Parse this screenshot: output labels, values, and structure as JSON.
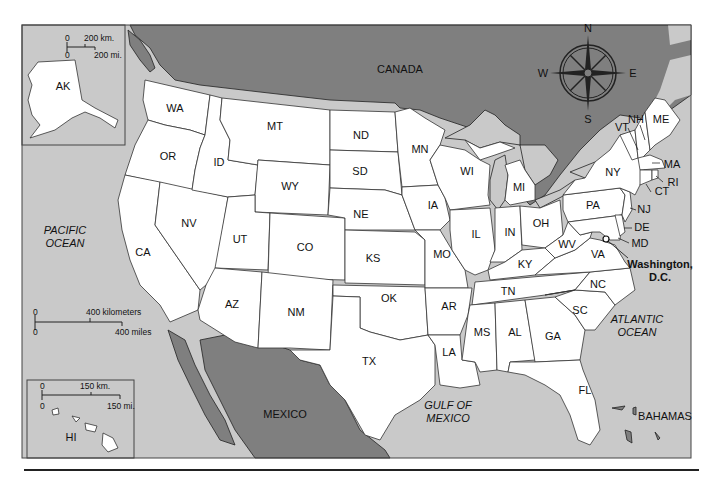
{
  "map": {
    "title": "United States",
    "countries": {
      "canada": "CANADA",
      "mexico": "MEXICO",
      "bahamas": "BAHAMAS"
    },
    "oceans": {
      "pacific": [
        "PACIFIC",
        "OCEAN"
      ],
      "atlantic": [
        "ATLANTIC",
        "OCEAN"
      ],
      "gulf": [
        "GULF OF",
        "MEXICO"
      ]
    },
    "capital": {
      "line1": "Washington,",
      "line2": "D.C."
    },
    "compass": {
      "n": "N",
      "s": "S",
      "e": "E",
      "w": "W"
    },
    "states": {
      "WA": "WA",
      "OR": "OR",
      "CA": "CA",
      "NV": "NV",
      "ID": "ID",
      "MT": "MT",
      "WY": "WY",
      "UT": "UT",
      "AZ": "AZ",
      "CO": "CO",
      "NM": "NM",
      "ND": "ND",
      "SD": "SD",
      "NE": "NE",
      "KS": "KS",
      "OK": "OK",
      "TX": "TX",
      "MN": "MN",
      "IA": "IA",
      "MO": "MO",
      "AR": "AR",
      "LA": "LA",
      "WI": "WI",
      "IL": "IL",
      "MI": "MI",
      "IN": "IN",
      "OH": "OH",
      "KY": "KY",
      "TN": "TN",
      "MS": "MS",
      "AL": "AL",
      "GA": "GA",
      "FL": "FL",
      "SC": "SC",
      "NC": "NC",
      "VA": "VA",
      "WV": "WV",
      "PA": "PA",
      "NY": "NY",
      "VT": "VT",
      "NH": "NH",
      "ME": "ME",
      "MA": "MA",
      "RI": "RI",
      "CT": "CT",
      "NJ": "NJ",
      "DE": "DE",
      "MD": "MD",
      "AK": "AK",
      "HI": "HI"
    },
    "scales": {
      "main": {
        "zero_km": "0",
        "km": "400 kilometers",
        "zero_mi": "0",
        "mi": "400 miles"
      },
      "alaska": {
        "zero_km": "0",
        "km": "200 km.",
        "zero_mi": "0",
        "mi": "200 mi."
      },
      "hawaii": {
        "zero_km": "0",
        "km": "150 km.",
        "zero_mi": "0",
        "mi": "150 mi."
      }
    },
    "colors": {
      "water": "#c9c9c9",
      "foreign_land": "#7f7f7f",
      "us_land": "#ffffff",
      "border": "#333333"
    }
  }
}
